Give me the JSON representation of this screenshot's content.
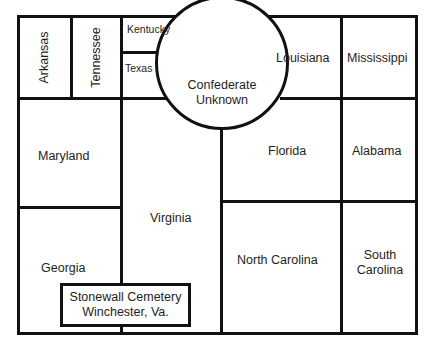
{
  "diagram": {
    "type": "cemetery plot layout",
    "line_color": "#111111",
    "background": "#ffffff",
    "sections": [
      {
        "id": "arkansas",
        "label": "Arkansas",
        "orientation": "vertical"
      },
      {
        "id": "tennessee",
        "label": "Tennessee",
        "orientation": "vertical"
      },
      {
        "id": "kentucky",
        "label": "Kentucky"
      },
      {
        "id": "texas",
        "label": "Texas"
      },
      {
        "id": "confederate_unknown",
        "label_line1": "Confederate",
        "label_line2": "Unknown",
        "shape": "circle"
      },
      {
        "id": "louisiana",
        "label": "Louisiana"
      },
      {
        "id": "mississippi",
        "label": "Mississippi"
      },
      {
        "id": "maryland",
        "label": "Maryland"
      },
      {
        "id": "virginia",
        "label": "Virginia"
      },
      {
        "id": "florida",
        "label": "Florida"
      },
      {
        "id": "alabama",
        "label": "Alabama"
      },
      {
        "id": "georgia",
        "label": "Georgia"
      },
      {
        "id": "north_carolina",
        "label": "North Carolina"
      },
      {
        "id": "south_carolina",
        "label_line1": "South",
        "label_line2": "Carolina"
      }
    ],
    "caption": {
      "line1": "Stonewall Cemetery",
      "line2": "Winchester, Va."
    }
  }
}
